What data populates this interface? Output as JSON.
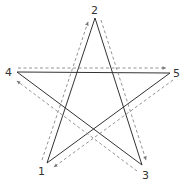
{
  "diagram": {
    "vertices": [
      {
        "id": "1",
        "label": "1",
        "x": 47,
        "y": 163,
        "lx": 40,
        "ly": 174
      },
      {
        "id": "2",
        "label": "2",
        "x": 95,
        "y": 18,
        "lx": 92,
        "ly": 14
      },
      {
        "id": "3",
        "label": "3",
        "x": 142,
        "y": 165,
        "lx": 143,
        "ly": 179
      },
      {
        "id": "4",
        "label": "4",
        "x": 17,
        "y": 72,
        "lx": 5,
        "ly": 76
      },
      {
        "id": "5",
        "label": "5",
        "x": 170,
        "y": 73,
        "lx": 173,
        "ly": 77
      }
    ],
    "stroke_order": [
      "1",
      "2",
      "3",
      "4",
      "5",
      "1"
    ],
    "colors": {
      "solid_line": "#333333",
      "dashed_arrow": "#888888",
      "label": "#333333"
    }
  }
}
